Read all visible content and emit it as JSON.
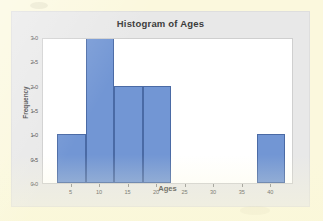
{
  "figure": {
    "panel_background": "#e8e8e8",
    "plot_background": "#ffffff",
    "page_background": "#fbf8dd"
  },
  "chart_data": {
    "type": "bar",
    "title": "Histogram of Ages",
    "xlabel": "Ages",
    "ylabel": "Frequency",
    "xlim": [
      0,
      44
    ],
    "ylim": [
      0.0,
      3.0
    ],
    "grid": false,
    "legend": false,
    "bar_color": "#7296d4",
    "bar_edge_color": "#4a6aa5",
    "bin_width": 5,
    "xticks": [
      5,
      10,
      15,
      20,
      25,
      30,
      35,
      40
    ],
    "xtick_labels": [
      "5",
      "10",
      "15",
      "20",
      "25",
      "30",
      "35",
      "40"
    ],
    "yticks": [
      0.0,
      0.5,
      1.0,
      1.5,
      2.0,
      2.5,
      3.0
    ],
    "ytick_labels": [
      "0.0",
      "0.5",
      "1.0",
      "1.5",
      "2.0",
      "2.5",
      "3.0"
    ],
    "bins": [
      {
        "bin_start": 2.5,
        "bin_end": 7.5,
        "center": 5,
        "frequency": 1
      },
      {
        "bin_start": 7.5,
        "bin_end": 12.5,
        "center": 10,
        "frequency": 3
      },
      {
        "bin_start": 12.5,
        "bin_end": 17.5,
        "center": 15,
        "frequency": 2
      },
      {
        "bin_start": 17.5,
        "bin_end": 22.5,
        "center": 20,
        "frequency": 2
      },
      {
        "bin_start": 22.5,
        "bin_end": 27.5,
        "center": 25,
        "frequency": 0
      },
      {
        "bin_start": 27.5,
        "bin_end": 32.5,
        "center": 30,
        "frequency": 0
      },
      {
        "bin_start": 32.5,
        "bin_end": 37.5,
        "center": 35,
        "frequency": 0
      },
      {
        "bin_start": 37.5,
        "bin_end": 42.5,
        "center": 40,
        "frequency": 1
      }
    ],
    "categories": [
      "2.5-7.5",
      "7.5-12.5",
      "12.5-17.5",
      "17.5-22.5",
      "22.5-27.5",
      "27.5-32.5",
      "32.5-37.5",
      "37.5-42.5"
    ],
    "values": [
      1,
      3,
      2,
      2,
      0,
      0,
      0,
      1
    ]
  }
}
